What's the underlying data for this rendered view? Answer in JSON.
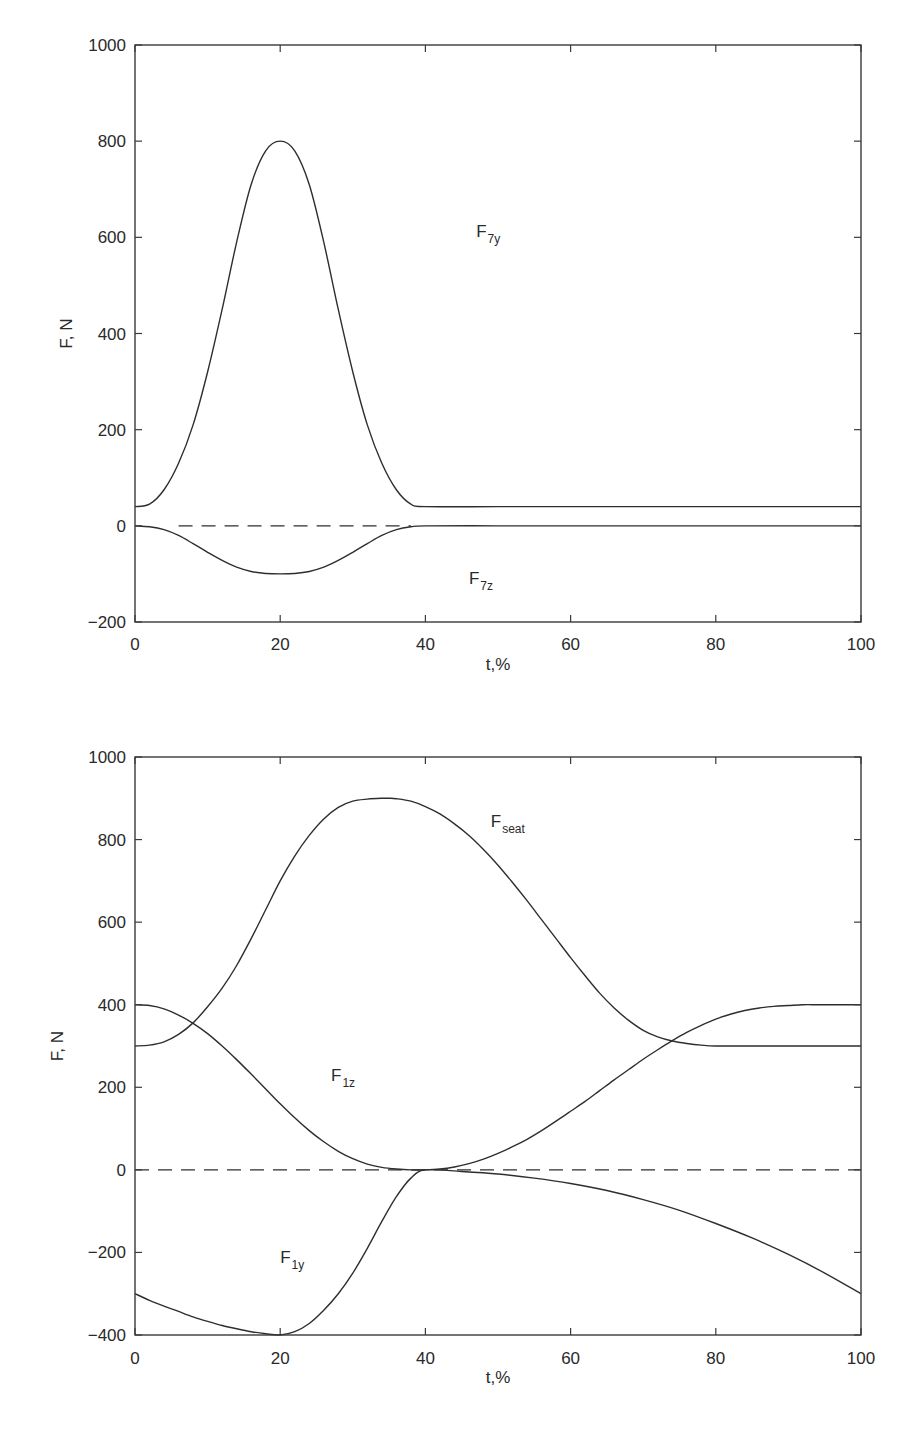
{
  "chart_data": [
    {
      "type": "line",
      "title": "",
      "xlabel": "t,%",
      "ylabel": "F, N",
      "xlim": [
        0,
        100
      ],
      "ylim": [
        -200,
        1000
      ],
      "xticks": [
        0,
        20,
        40,
        60,
        80,
        100
      ],
      "yticks": [
        -200,
        0,
        200,
        400,
        600,
        800,
        1000
      ],
      "xtick_labels": [
        "0",
        "20",
        "40",
        "60",
        "80",
        "100"
      ],
      "ytick_labels": [
        "−200",
        "0",
        "200",
        "400",
        "600",
        "800",
        "1000"
      ],
      "grid": false,
      "legend": "inline labels",
      "series": [
        {
          "name": "F7y",
          "label_main": "F",
          "label_sub": "7y",
          "style": "solid",
          "label_pos": [
            47,
            600
          ],
          "x": [
            0,
            2,
            4,
            6,
            8,
            10,
            12,
            14,
            16,
            18,
            20,
            22,
            24,
            26,
            28,
            30,
            32,
            34,
            36,
            38,
            40,
            50,
            60,
            70,
            80,
            90,
            100
          ],
          "values": [
            40,
            45,
            75,
            130,
            210,
            320,
            450,
            590,
            710,
            780,
            800,
            780,
            710,
            590,
            450,
            320,
            210,
            130,
            75,
            45,
            40,
            40,
            40,
            40,
            40,
            40,
            40
          ]
        },
        {
          "name": "F7z",
          "label_main": "F",
          "label_sub": "7z",
          "style": "solid",
          "label_pos": [
            46,
            -120
          ],
          "x": [
            0,
            2,
            4,
            6,
            8,
            10,
            12,
            14,
            16,
            18,
            20,
            22,
            24,
            26,
            28,
            30,
            32,
            34,
            36,
            38,
            40,
            50,
            60,
            70,
            80,
            90,
            100
          ],
          "values": [
            0,
            -2,
            -8,
            -20,
            -37,
            -55,
            -72,
            -86,
            -95,
            -99,
            -100,
            -99,
            -95,
            -86,
            -72,
            -55,
            -37,
            -20,
            -8,
            -2,
            0,
            0,
            0,
            0,
            0,
            0,
            0
          ]
        },
        {
          "name": "zero reference",
          "style": "dashed",
          "x": [
            6,
            38
          ],
          "values": [
            0,
            0
          ]
        }
      ]
    },
    {
      "type": "line",
      "title": "",
      "xlabel": "t,%",
      "ylabel": "F, N",
      "xlim": [
        0,
        100
      ],
      "ylim": [
        -400,
        1000
      ],
      "xticks": [
        0,
        20,
        40,
        60,
        80,
        100
      ],
      "yticks": [
        -400,
        -200,
        0,
        200,
        400,
        600,
        800,
        1000
      ],
      "xtick_labels": [
        "0",
        "20",
        "40",
        "60",
        "80",
        "100"
      ],
      "ytick_labels": [
        "−400",
        "−200",
        "0",
        "200",
        "400",
        "600",
        "800",
        "1000"
      ],
      "grid": false,
      "legend": "inline labels",
      "series": [
        {
          "name": "Fseat",
          "label_main": "F",
          "label_sub": "seat",
          "style": "solid",
          "label_pos": [
            49,
            830
          ],
          "x": [
            0,
            2,
            4,
            6,
            8,
            10,
            12,
            14,
            16,
            18,
            20,
            22,
            24,
            26,
            28,
            30,
            32,
            34,
            35,
            36,
            38,
            40,
            42,
            44,
            46,
            48,
            50,
            52,
            54,
            56,
            58,
            60,
            62,
            64,
            66,
            68,
            70,
            72,
            74,
            76,
            78,
            80,
            85,
            90,
            100
          ],
          "values": [
            300,
            302,
            310,
            328,
            356,
            395,
            440,
            495,
            560,
            630,
            700,
            760,
            810,
            850,
            878,
            893,
            898,
            900,
            900,
            899,
            893,
            880,
            862,
            838,
            810,
            776,
            738,
            696,
            652,
            606,
            560,
            514,
            470,
            428,
            392,
            362,
            338,
            322,
            312,
            306,
            302,
            300,
            300,
            300,
            300
          ]
        },
        {
          "name": "F1z",
          "label_main": "F",
          "label_sub": "1z",
          "style": "solid",
          "label_pos": [
            27,
            215
          ],
          "x": [
            0,
            2,
            4,
            6,
            8,
            10,
            12,
            14,
            16,
            18,
            20,
            22,
            24,
            26,
            28,
            30,
            32,
            34,
            36,
            38,
            40,
            42,
            44,
            46,
            48,
            50,
            52,
            54,
            56,
            58,
            60,
            62,
            64,
            66,
            68,
            70,
            72,
            74,
            76,
            78,
            80,
            82,
            84,
            86,
            88,
            90,
            92,
            94,
            96,
            98,
            100
          ],
          "values": [
            400,
            398,
            390,
            375,
            355,
            330,
            300,
            267,
            232,
            196,
            160,
            126,
            95,
            68,
            45,
            27,
            14,
            6,
            2,
            0,
            0,
            2,
            7,
            15,
            26,
            40,
            56,
            74,
            95,
            118,
            142,
            166,
            192,
            218,
            243,
            268,
            291,
            313,
            333,
            350,
            365,
            377,
            386,
            392,
            396,
            398,
            400,
            400,
            400,
            400,
            400
          ]
        },
        {
          "name": "F1y",
          "label_main": "F",
          "label_sub": "1y",
          "style": "solid",
          "label_pos": [
            20,
            -225
          ],
          "x": [
            0,
            2,
            4,
            6,
            8,
            10,
            12,
            14,
            16,
            18,
            20,
            22,
            24,
            26,
            28,
            30,
            32,
            34,
            36,
            38,
            40,
            45,
            50,
            55,
            60,
            65,
            70,
            75,
            80,
            85,
            90,
            95,
            100
          ],
          "values": [
            -300,
            -316,
            -330,
            -343,
            -356,
            -367,
            -377,
            -385,
            -392,
            -397,
            -400,
            -392,
            -372,
            -340,
            -300,
            -250,
            -190,
            -125,
            -65,
            -20,
            0,
            -4,
            -10,
            -20,
            -33,
            -50,
            -72,
            -98,
            -130,
            -165,
            -205,
            -250,
            -300
          ]
        },
        {
          "name": "zero reference",
          "style": "dashed",
          "x": [
            0,
            100
          ],
          "values": [
            0,
            0
          ]
        }
      ]
    }
  ]
}
